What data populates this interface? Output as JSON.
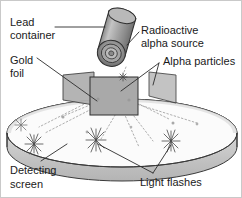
{
  "figure": {
    "background_color": "#ffffff",
    "border_color": "#c9c9c9",
    "ink_color": "#1a1a1a",
    "line_color": "#3a3a3a",
    "ray_color": "#8d8d8d"
  },
  "labels": {
    "lead_container_line1": "Lead",
    "lead_container_line2": "container",
    "gold_foil_line1": "Gold",
    "gold_foil_line2": "foil",
    "radioactive_source_line1": "Radioactive",
    "radioactive_source_line2": "alpha source",
    "alpha_particles": "Alpha particles",
    "detecting_screen_line1": "Detecting",
    "detecting_screen_line2": "screen",
    "light_flashes": "Light flashes"
  },
  "parts": {
    "lead_container": {
      "name": "Lead container",
      "shape": "tilted cylinder",
      "fill": "#9a9a9a",
      "highlight": "#c2c2c2",
      "shade": "#6f6f6f"
    },
    "alpha_source": {
      "name": "Radioactive alpha source",
      "shape": "concentric rings at cylinder aperture",
      "fill": "#7d7d7d"
    },
    "gold_foil": {
      "name": "Gold foil",
      "shape": "small parallelogram",
      "fill": "#a8a8a8"
    },
    "specimen_block": {
      "name": "Central block",
      "shape": "rectangle",
      "fill": "#a9a9a9",
      "stroke": "#3a3a3a"
    },
    "detecting_screen": {
      "name": "Detecting screen",
      "shape": "elliptical cylindrical band",
      "band_fill": "#c6c6c6",
      "floor_fill": "#f4f4f4",
      "stroke": "#3a3a3a"
    },
    "light_flashes": {
      "name": "Light flashes",
      "shape": "star bursts",
      "count": 4,
      "color": "#4a4a4a"
    },
    "alpha_particles": {
      "name": "Alpha particles",
      "shape": "dotted ray paths",
      "color": "#8d8d8d"
    }
  },
  "layout": {
    "width": 242,
    "height": 198
  }
}
